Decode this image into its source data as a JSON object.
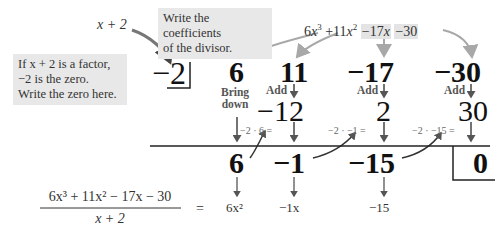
{
  "annotations": {
    "divisor_label": "x + 2",
    "coefficients_note": [
      "Write the coefficients",
      "of the divisor."
    ],
    "zero_note": [
      "If x + 2 is a factor,",
      "−2 is the zero.",
      "Write the zero here."
    ]
  },
  "dividend": {
    "terms": [
      {
        "coef": "6",
        "var": "x",
        "exp": "3",
        "highlight": false
      },
      {
        "coef": "+11",
        "var": "x",
        "exp": "2",
        "highlight": false
      },
      {
        "coef": "−17",
        "var": "x",
        "exp": "",
        "highlight": true
      },
      {
        "coef": "−30",
        "var": "",
        "exp": "",
        "highlight": true
      }
    ]
  },
  "divisor_zero": "−2",
  "row1_coefficients": [
    "6",
    "11",
    "−17",
    "−30"
  ],
  "step_labels": {
    "bring_down": [
      "Bring",
      "down"
    ],
    "add": "Add"
  },
  "row2_products": [
    "−12",
    "2",
    "30"
  ],
  "multiply_labels": [
    "−2 · 6 =",
    "−2 · −1 =",
    "−2 · −15 ="
  ],
  "row3_results": [
    "6",
    "−1",
    "−15"
  ],
  "remainder": "0",
  "quotient_terms": [
    "6x²",
    "−1x",
    "−15"
  ],
  "equation": {
    "numerator": "6x³ + 11x² − 17x − 30",
    "denominator": "x + 2",
    "equals": "="
  },
  "colors": {
    "note_background": "#e8e8e8",
    "arrow_gray": "#a8a8a8",
    "arrow_dark": "#444444",
    "text_dark": "#111111"
  }
}
